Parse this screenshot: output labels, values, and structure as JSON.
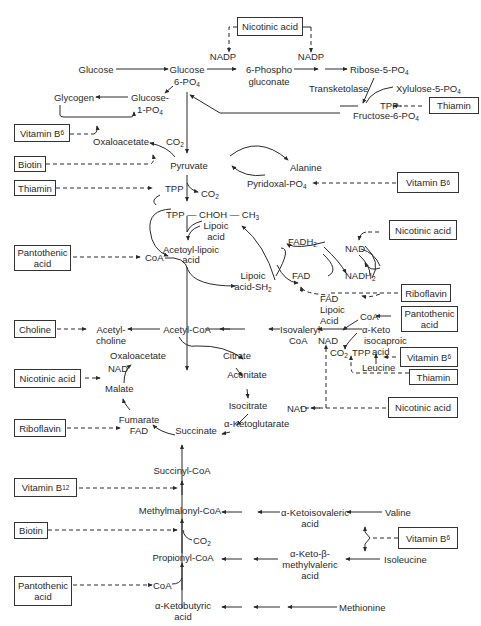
{
  "vitamins": {
    "nicotinic_top": "Nicotinic acid",
    "thiamin_ppp": "Thiamin",
    "b6_oaa": "Vitamin B",
    "b6_oaa_sub": "6",
    "biotin_pyr": "Biotin",
    "thiamin_pdh": "Thiamin",
    "b6_ala": "Vitamin B",
    "b6_ala_sub": "6",
    "pantothenic_coa": "Pantothenic acid",
    "nicotinic_nad": "Nicotinic acid",
    "riboflavin_fad": "Riboflavin",
    "pantothenic_leu": "Pantothenic acid",
    "b6_leu": "Vitamin B",
    "b6_leu_sub": "6",
    "thiamin_leu": "Thiamin",
    "nicotinic_leu": "Nicotinic acid",
    "choline": "Choline",
    "nicotinic_tca": "Nicotinic acid",
    "riboflavin_tca": "Riboflavin",
    "b12": "Vitamin B",
    "b12_sub": "12",
    "biotin_prop": "Biotin",
    "pantothenic_prop": "Pantothenic acid",
    "b6_bcaa": "Vitamin B",
    "b6_bcaa_sub": "6"
  },
  "metabolites": {
    "nadp_left": "NADP",
    "nadp_right": "NADP",
    "glucose": "Glucose",
    "glucose6p_a": "Glucose",
    "glucose6p_b": "6-PO",
    "phosphogluconate_a": "6-Phospho",
    "phosphogluconate_b": "gluconate",
    "ribose5p": "Ribose-5-PO",
    "transketolase": "Transketolase",
    "xylulose5p": "Xylulose-5-PO",
    "tpp_ppp": "TPP",
    "fructose6p": "Fructose-6-PO",
    "glycogen": "Glycogen",
    "glucose1p_a": "Glucose-",
    "glucose1p_b": "1-PO",
    "oxaloacetate_top": "Oxaloacetate",
    "co2_oaa": "CO",
    "pyruvate": "Pyruvate",
    "alanine": "Alanine",
    "pyridoxal": "Pyridoxal-PO",
    "tpp_pdh": "TPP",
    "co2_pdh": "CO",
    "tpp_choh": "TPP — CHOH — CH",
    "lipoic_a": "Lipoic",
    "lipoic_b": "acid",
    "acetoyl_a": "Acetoyl-lipoic",
    "acetoyl_b": "acid",
    "coa_pdh": "CoA",
    "fadh2": "FADH",
    "nad_pdh": "NAD",
    "fad_pdh": "FAD",
    "nadh2": "NADH",
    "lipoic_sh2_a": "Lipoic",
    "lipoic_sh2_b": "acid-SH",
    "fad_leu": "FAD",
    "lipoic_leu_a": "Lipoic",
    "lipoic_leu_b": "Acid",
    "coa_leu": "CoA",
    "ketoisocaproic_a": "α-Keto",
    "ketoisocaproic_b": "isocaproic",
    "ketoisocaproic_c": "acid",
    "isovaleryl_a": "Isovaleryl-",
    "isovaleryl_b": "CoA",
    "nad_leu": "NAD",
    "co2_leu": "CO",
    "tpp_leu": "TPP",
    "leucine": "Leucine",
    "acetylcholine_a": "Acetyl-",
    "acetylcholine_b": "choline",
    "acetyl_coa": "Acetyl-CoA",
    "oxaloacetate_tca": "Oxaloacetate",
    "citrate": "Citrate",
    "nad_tca": "NAD",
    "aconitate": "Aconitate",
    "malate": "Malate",
    "isocitrate": "Isocitrate",
    "nad_icdh": "NAD",
    "fumarate": "Fumarate",
    "fad_tca": "FAD",
    "succinate": "Succinate",
    "ketoglutarate": "α-Ketoglutarate",
    "succinyl_coa": "Succinyl-CoA",
    "methylmalonyl_coa": "Methylmalonyl-CoA",
    "ketoisovaleric_a": "α-Ketoisovaleric",
    "ketoisovaleric_b": "acid",
    "valine": "Valine",
    "co2_prop": "CO",
    "propionyl_coa": "Propionyl-CoA",
    "ketomethylvaleric_a": "α-Keto-β-",
    "ketomethylvaleric_b": "methylvaleric",
    "ketomethylvaleric_c": "acid",
    "isoleucine": "Isoleucine",
    "coa_prop": "CoA",
    "ketobutyric_a": "α-Ketobutyric",
    "ketobutyric_b": "acid",
    "methionine": "Methionine"
  },
  "subscripts": {
    "po4": "4",
    "co2": "2",
    "h2": "2",
    "ch3": "3"
  },
  "colors": {
    "ink": "#2a2a2a",
    "background": "#ffffff"
  }
}
